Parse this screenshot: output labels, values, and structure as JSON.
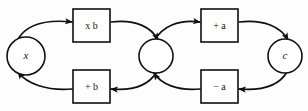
{
  "diagram": {
    "type": "flow-cycle-diagram",
    "background_color": "#fdfdfd",
    "stroke_color": "#101010",
    "fill_color": "#ffffff",
    "nodes": [
      {
        "id": "x",
        "kind": "circle",
        "label": "x",
        "cx": 26,
        "cy": 56,
        "r": 19
      },
      {
        "id": "mid",
        "kind": "circle",
        "label": "",
        "cx": 156,
        "cy": 56,
        "r": 17
      },
      {
        "id": "c",
        "kind": "circle",
        "label": "c",
        "cx": 285,
        "cy": 56,
        "r": 17
      },
      {
        "id": "mul_b",
        "kind": "box",
        "label": "x b",
        "x": 73,
        "y": 9,
        "w": 37,
        "h": 33
      },
      {
        "id": "add_b",
        "kind": "box",
        "label": "+ b",
        "x": 73,
        "y": 70,
        "w": 37,
        "h": 33
      },
      {
        "id": "add_a",
        "kind": "box",
        "label": "+ a",
        "x": 201,
        "y": 9,
        "w": 37,
        "h": 33
      },
      {
        "id": "sub_a",
        "kind": "box",
        "label": "− a",
        "x": 201,
        "y": 70,
        "w": 37,
        "h": 33
      }
    ],
    "edges": [
      {
        "id": "x-to-mul_b",
        "from": "x",
        "to": "mul_b",
        "direction": "right",
        "arrow": true
      },
      {
        "id": "mul_b-to-mid",
        "from": "mul_b",
        "to": "mid",
        "direction": "right",
        "arrow": true
      },
      {
        "id": "mid-to-add_b",
        "from": "mid",
        "to": "add_b",
        "direction": "left",
        "arrow": true
      },
      {
        "id": "add_b-to-x",
        "from": "add_b",
        "to": "x",
        "direction": "left",
        "arrow": true
      },
      {
        "id": "mid-to-add_a",
        "from": "mid",
        "to": "add_a",
        "direction": "right",
        "arrow": true
      },
      {
        "id": "add_a-to-c",
        "from": "add_a",
        "to": "c",
        "direction": "right",
        "arrow": true
      },
      {
        "id": "c-to-sub_a",
        "from": "c",
        "to": "sub_a",
        "direction": "left",
        "arrow": true
      },
      {
        "id": "sub_a-to-mid",
        "from": "sub_a",
        "to": "mid",
        "direction": "left",
        "arrow": true
      }
    ]
  }
}
